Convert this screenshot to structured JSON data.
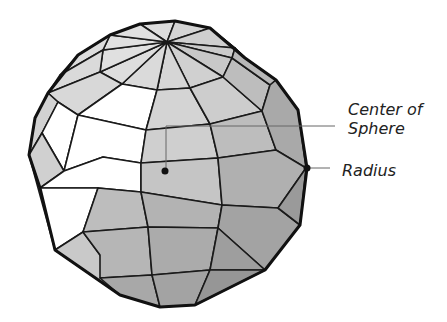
{
  "diagram": {
    "labels": {
      "center_line1": "Center of",
      "center_line2": "Sphere",
      "radius": "Radius"
    },
    "colors": {
      "light_face": "#d9d9d9",
      "mid_face": "#bdbdbd",
      "dark_face": "#9a9a9a",
      "white_face": "#ffffff",
      "edge": "#1a1a1a",
      "leader": "#666666"
    }
  }
}
